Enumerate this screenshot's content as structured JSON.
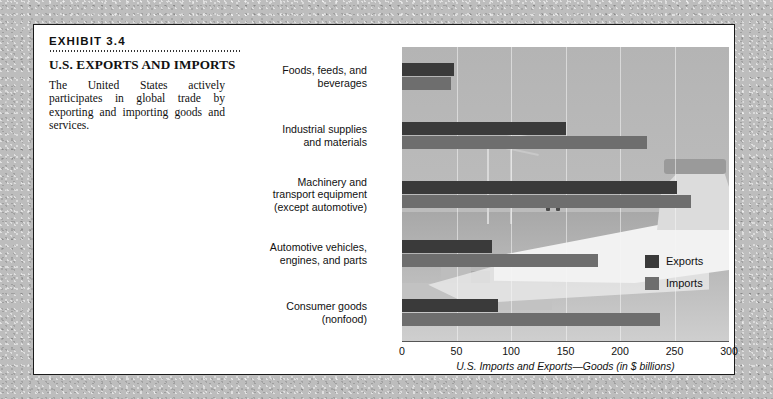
{
  "exhibit": {
    "number": "EXHIBIT 3.4",
    "title": "U.S. EXPORTS AND IMPORTS",
    "description": "The United States actively participates in global trade by exporting and importing goods and services."
  },
  "legend": {
    "exports_label": "Exports",
    "imports_label": "Imports",
    "exports_color": "#3a3a3a",
    "imports_color": "#6e6e6e"
  },
  "chart_data": {
    "type": "bar",
    "orientation": "horizontal",
    "title": "U.S. EXPORTS AND IMPORTS",
    "xlabel": "U.S. Imports and Exports—Goods (in $ billions)",
    "ylabel": "",
    "xlim": [
      0,
      300
    ],
    "xticks": [
      0,
      50,
      100,
      150,
      200,
      250,
      300
    ],
    "xtick_labels": [
      "0",
      "50",
      "100",
      "150",
      "200",
      "250",
      "300"
    ],
    "grid": true,
    "legend_position": "center-right",
    "categories": [
      "Foods, feeds, and beverages",
      "Industrial supplies and materials",
      "Machinery and transport equipment (except automotive)",
      "Automotive vehicles, engines, and parts",
      "Consumer goods (nonfood)"
    ],
    "category_lines": [
      [
        "Foods, feeds, and",
        "beverages"
      ],
      [
        "Industrial supplies",
        "and materials"
      ],
      [
        "Machinery and",
        "transport equipment",
        "(except automotive)"
      ],
      [
        "Automotive vehicles,",
        "engines, and parts"
      ],
      [
        "Consumer goods",
        "(nonfood)"
      ]
    ],
    "series": [
      {
        "name": "Exports",
        "color": "#3a3a3a",
        "values": [
          48,
          150,
          252,
          83,
          88
        ]
      },
      {
        "name": "Imports",
        "color": "#6e6e6e",
        "values": [
          45,
          225,
          265,
          180,
          237
        ]
      }
    ]
  }
}
